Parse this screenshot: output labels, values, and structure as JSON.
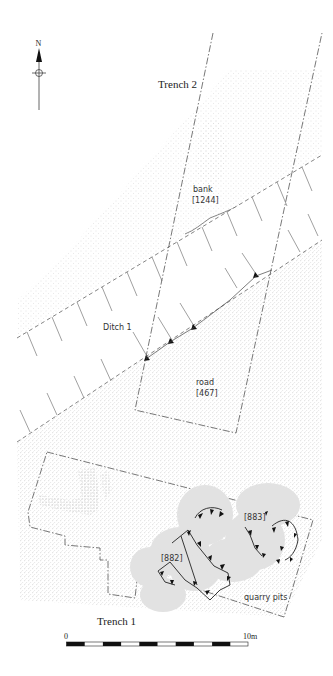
{
  "figure": {
    "north_label": "N",
    "labels": {
      "trench2": "Trench 2",
      "trench1": "Trench 1",
      "bank": "bank",
      "bank_context": "[1244]",
      "ditch": "Ditch 1",
      "road": "road",
      "road_context": "[467]",
      "pit_a": "[882]",
      "pit_b": "[883]",
      "quarry": "quarry pits"
    },
    "scale": {
      "start_label": "0",
      "end_label": "10m",
      "segments": 10
    },
    "colors": {
      "stipple": "#bdbdbd",
      "road_stipple": "#a8a8a8",
      "pit_fill": "#e3e3e3",
      "line": "#555555",
      "text": "#222222"
    }
  }
}
